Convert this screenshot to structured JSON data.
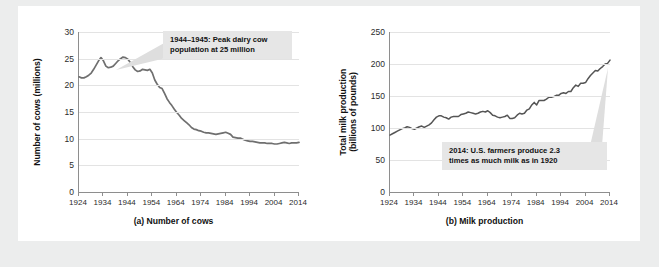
{
  "figure": {
    "background_color": "#eceded",
    "card_color": "#ffffff",
    "line_color": "#6f6f6f",
    "callout_bg": "#e6e6e6"
  },
  "chart_data": [
    {
      "type": "line",
      "panel": "a",
      "title": "",
      "caption": "(a) Number of cows",
      "ylabel": "Number of cows (millions)",
      "xlabel": "",
      "grid": true,
      "legend": "none",
      "xlim": [
        1924,
        2014
      ],
      "ylim": [
        0,
        30
      ],
      "yticks": [
        0,
        5,
        10,
        15,
        20,
        25,
        30
      ],
      "xticks": [
        1924,
        1934,
        1944,
        1954,
        1964,
        1974,
        1984,
        1994,
        2004,
        2014
      ],
      "annotation": "1944–1945: Peak dairy cow\npopulation at 25 million",
      "x": [
        1924,
        1925,
        1926,
        1927,
        1928,
        1929,
        1930,
        1931,
        1932,
        1933,
        1934,
        1935,
        1936,
        1937,
        1938,
        1939,
        1940,
        1941,
        1942,
        1943,
        1944,
        1945,
        1946,
        1947,
        1948,
        1949,
        1950,
        1951,
        1952,
        1953,
        1954,
        1955,
        1956,
        1957,
        1958,
        1959,
        1960,
        1961,
        1962,
        1963,
        1964,
        1965,
        1966,
        1967,
        1968,
        1969,
        1970,
        1971,
        1972,
        1973,
        1974,
        1975,
        1976,
        1977,
        1978,
        1979,
        1980,
        1981,
        1982,
        1983,
        1984,
        1985,
        1986,
        1987,
        1988,
        1989,
        1990,
        1991,
        1992,
        1993,
        1994,
        1995,
        1996,
        1997,
        1998,
        1999,
        2000,
        2001,
        2002,
        2003,
        2004,
        2005,
        2006,
        2007,
        2008,
        2009,
        2010,
        2011,
        2012,
        2013,
        2014
      ],
      "values": [
        21.6,
        21.4,
        21.4,
        21.6,
        21.9,
        22.3,
        23.0,
        23.8,
        24.6,
        25.2,
        24.6,
        23.6,
        23.3,
        23.4,
        23.6,
        24.1,
        24.6,
        25.0,
        25.3,
        25.2,
        24.9,
        24.3,
        23.5,
        22.9,
        22.6,
        22.7,
        23.0,
        22.9,
        22.8,
        23.0,
        22.3,
        21.0,
        20.2,
        19.6,
        19.4,
        18.5,
        17.5,
        16.8,
        16.2,
        15.5,
        14.9,
        14.4,
        13.8,
        13.4,
        13.0,
        12.6,
        12.1,
        11.8,
        11.7,
        11.5,
        11.4,
        11.2,
        11.1,
        11.1,
        11.0,
        10.9,
        10.8,
        10.9,
        11.0,
        11.1,
        11.2,
        11.0,
        10.8,
        10.3,
        10.2,
        10.1,
        10.1,
        9.9,
        9.7,
        9.6,
        9.5,
        9.5,
        9.4,
        9.3,
        9.2,
        9.2,
        9.2,
        9.1,
        9.1,
        9.1,
        9.0,
        9.0,
        9.1,
        9.2,
        9.3,
        9.2,
        9.1,
        9.2,
        9.2,
        9.2,
        9.3
      ]
    },
    {
      "type": "line",
      "panel": "b",
      "title": "",
      "caption": "(b) Milk production",
      "ylabel": "Total milk production (billions of pounds)",
      "xlabel": "",
      "grid": true,
      "legend": "none",
      "xlim": [
        1924,
        2014
      ],
      "ylim": [
        0,
        250
      ],
      "yticks": [
        0,
        50,
        100,
        150,
        200,
        250
      ],
      "xticks": [
        1924,
        1934,
        1944,
        1954,
        1964,
        1974,
        1984,
        1994,
        2004,
        2014
      ],
      "annotation": "2014: U.S. farmers produce 2.3\ntimes as much milk as in 1920",
      "x": [
        1924,
        1925,
        1926,
        1927,
        1928,
        1929,
        1930,
        1931,
        1932,
        1933,
        1934,
        1935,
        1936,
        1937,
        1938,
        1939,
        1940,
        1941,
        1942,
        1943,
        1944,
        1945,
        1946,
        1947,
        1948,
        1949,
        1950,
        1951,
        1952,
        1953,
        1954,
        1955,
        1956,
        1957,
        1958,
        1959,
        1960,
        1961,
        1962,
        1963,
        1964,
        1965,
        1966,
        1967,
        1968,
        1969,
        1970,
        1971,
        1972,
        1973,
        1974,
        1975,
        1976,
        1977,
        1978,
        1979,
        1980,
        1981,
        1982,
        1983,
        1984,
        1985,
        1986,
        1987,
        1988,
        1989,
        1990,
        1991,
        1992,
        1993,
        1994,
        1995,
        1996,
        1997,
        1998,
        1999,
        2000,
        2001,
        2002,
        2003,
        2004,
        2005,
        2006,
        2007,
        2008,
        2009,
        2010,
        2011,
        2012,
        2013,
        2014
      ],
      "values": [
        89,
        91,
        93,
        95,
        97,
        99,
        100,
        102,
        101,
        99,
        98,
        100,
        102,
        103,
        101,
        103,
        105,
        108,
        113,
        117,
        119,
        119,
        117,
        116,
        114,
        117,
        118,
        118,
        118,
        121,
        122,
        123,
        125,
        124,
        123,
        122,
        123,
        125,
        126,
        125,
        127,
        124,
        120,
        119,
        117,
        116,
        117,
        118,
        120,
        115,
        115,
        116,
        120,
        123,
        122,
        123,
        128,
        130,
        136,
        140,
        136,
        143,
        143,
        143,
        145,
        148,
        148,
        149,
        151,
        151,
        154,
        155,
        154,
        157,
        157,
        163,
        167,
        165,
        170,
        170,
        171,
        177,
        182,
        186,
        190,
        189,
        193,
        196,
        200,
        201,
        206
      ]
    }
  ]
}
